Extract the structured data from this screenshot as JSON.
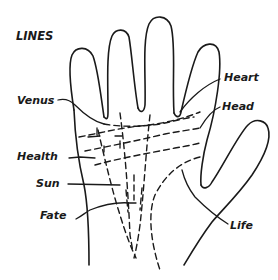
{
  "diagram": {
    "title": "LINES",
    "labels": {
      "venus": "Venus",
      "heart": "Heart",
      "head": "Head",
      "health": "Health",
      "sun": "Sun",
      "fate": "Fate",
      "life": "Life"
    },
    "colors": {
      "ink": "#1a1a1a",
      "background": "#ffffff"
    }
  }
}
